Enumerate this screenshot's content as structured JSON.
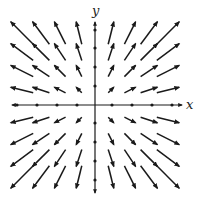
{
  "diagram": {
    "title": "",
    "type": "vector-field",
    "field": "F(x,y) = (x, y)",
    "axes": {
      "x_label": "x",
      "y_label": "y",
      "origin_px": [
        95,
        105
      ],
      "x_extent_px": [
        12,
        182
      ],
      "y_extent_px": [
        22,
        193
      ],
      "x_tick_px": [
        17,
        37,
        57,
        77,
        112,
        132,
        152,
        172
      ],
      "y_tick_px": [
        30,
        48,
        67,
        86,
        123,
        142,
        161,
        180
      ]
    },
    "grid": {
      "levels": [
        -4,
        -3,
        -2,
        -1,
        1,
        2,
        3,
        4
      ],
      "x_center_px": {
        "-4": 22,
        "-3": 41,
        "-2": 60,
        "-1": 79,
        "1": 111,
        "2": 130,
        "3": 149,
        "4": 168
      },
      "y_center_px": {
        "4": 33,
        "3": 52,
        "2": 71,
        "1": 90,
        "-1": 120,
        "-2": 139,
        "-3": 158,
        "-4": 177
      },
      "length_scale_px": 5.6
    },
    "colors": {
      "arrow": "#1a1a1a",
      "axis": "#1a1a1a",
      "background": "#ffffff"
    }
  }
}
